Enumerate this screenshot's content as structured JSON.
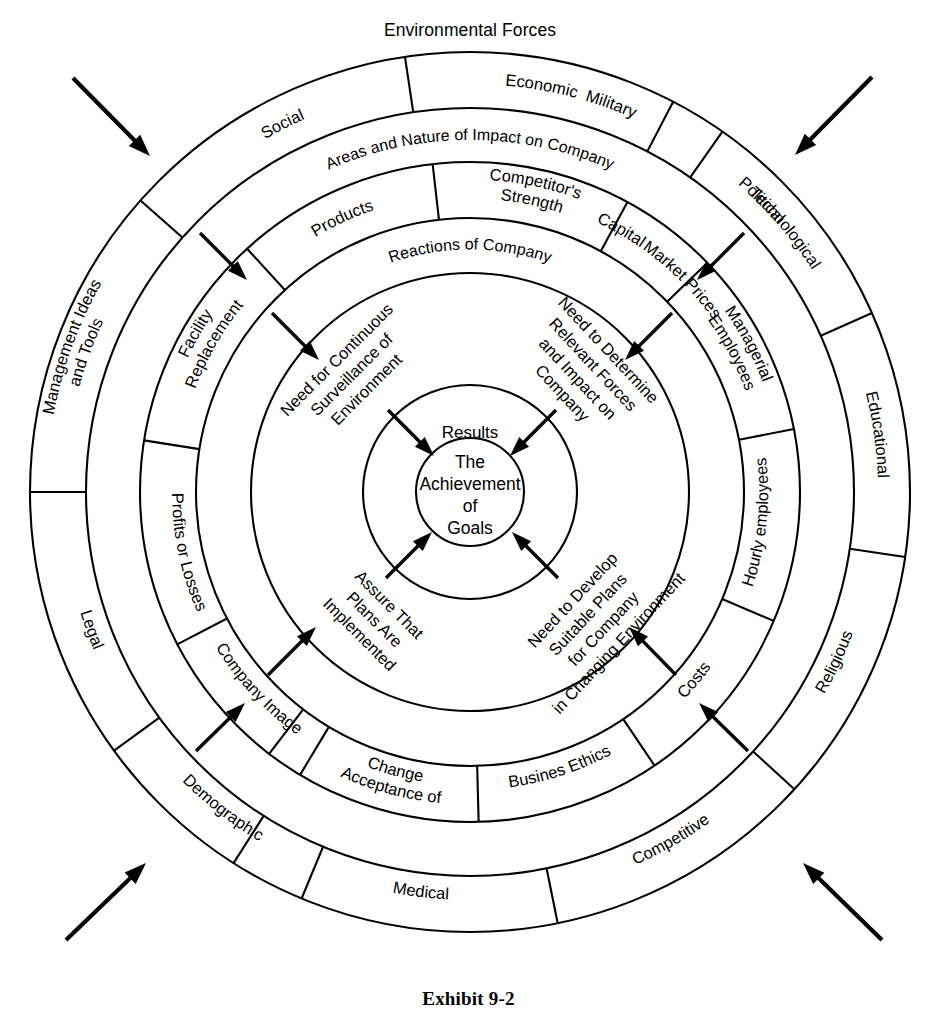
{
  "diagram": {
    "title": "Environmental Forces",
    "caption": "Exhibit 9-2",
    "center_x": 470,
    "center_y": 492,
    "colors": {
      "stroke": "#000000",
      "background": "#ffffff"
    }
  },
  "rings": {
    "ring1": {
      "name": "Environmental Forces",
      "label": "Environmental Forces",
      "r_outer": 440,
      "r_inner": 384,
      "segments": [
        {
          "label": "Military",
          "mid_deg": -70
        },
        {
          "label": "Technological",
          "mid_deg": -40
        },
        {
          "label": "Educational",
          "mid_deg": -8
        },
        {
          "label": "Religious",
          "mid_deg": 25
        },
        {
          "label": "Competitive",
          "mid_deg": 60
        },
        {
          "label": "Medical",
          "mid_deg": 97
        },
        {
          "label": "Demographic",
          "mid_deg": 128
        },
        {
          "label": "Legal",
          "mid_deg": 160
        },
        {
          "label": "Management Ideas and Tools",
          "mid_deg": 200
        },
        {
          "label": "Social",
          "mid_deg": 243
        },
        {
          "label": "Economic",
          "mid_deg": 280
        },
        {
          "label": "Political",
          "mid_deg": 315
        }
      ]
    },
    "ring2": {
      "name": "Areas and Nature of Impact on Company",
      "label": "Areas and Nature of Impact on Company",
      "r_outer": 384,
      "r_inner": 330
    },
    "ring3": {
      "name": "Company Impact Areas",
      "r_outer": 330,
      "r_inner": 274,
      "segments": [
        {
          "label": "Capital",
          "mid_deg": -60
        },
        {
          "label": "Managerial Employees",
          "mid_deg": -28
        },
        {
          "label": "Hourly employees",
          "mid_deg": 6
        },
        {
          "label": "Costs",
          "mid_deg": 40
        },
        {
          "label": "Busines Ethics",
          "mid_deg": 72
        },
        {
          "label": "Acceptance of Change",
          "mid_deg": 105
        },
        {
          "label": "Company Image",
          "mid_deg": 137
        },
        {
          "label": "Profits or Losses",
          "mid_deg": 168
        },
        {
          "label": "Facility Replacement",
          "mid_deg": 210
        },
        {
          "label": "Products",
          "mid_deg": 245
        },
        {
          "label": "Competitor's Strength",
          "mid_deg": 282
        },
        {
          "label": "Market Prices",
          "mid_deg": 315
        }
      ]
    },
    "ring4": {
      "name": "Reactions of Company",
      "label": "Reactions of Company",
      "r_outer": 274,
      "r_inner": 219
    },
    "ring5": {
      "name": "Company Actions",
      "r_outer": 219,
      "r_inner": 107,
      "quadrant_texts": [
        {
          "lines": [
            "Need for Continuous",
            "Surveillance of",
            "Environment"
          ],
          "mid_deg": 310
        },
        {
          "lines": [
            "Need to Determine",
            "Relevant Forces",
            "and Impact on",
            "Company"
          ],
          "mid_deg": 320
        },
        {
          "lines": [
            "Assure That",
            "Plans Are",
            "Implemented"
          ],
          "mid_deg": 220
        },
        {
          "lines": [
            "Need to Develop",
            "Suitable Plans",
            "for Company",
            "in Changing Environment"
          ],
          "mid_deg": 50
        }
      ]
    },
    "ring6": {
      "name": "Results",
      "label": "Results",
      "r_outer": 107,
      "r_inner": 54
    },
    "center": {
      "name": "The Achievement of Goals",
      "lines": [
        "The",
        "Achievement",
        "of",
        "Goals"
      ],
      "r": 54
    }
  },
  "arrows": {
    "outer": [
      {
        "name": "arrow-outer-top-left",
        "from": [
          73,
          78
        ],
        "to": [
          150,
          156
        ]
      },
      {
        "name": "arrow-outer-top-right",
        "from": [
          872,
          77
        ],
        "to": [
          795,
          155
        ]
      },
      {
        "name": "arrow-outer-bottom-left",
        "from": [
          66,
          940
        ],
        "to": [
          146,
          863
        ]
      },
      {
        "name": "arrow-outer-bottom-right",
        "from": [
          882,
          940
        ],
        "to": [
          803,
          863
        ]
      }
    ],
    "ring2": [
      {
        "name": "arrow-ring2-top-left",
        "from": [
          200,
          233
        ],
        "to": [
          247,
          280
        ]
      },
      {
        "name": "arrow-ring2-top-right",
        "from": [
          744,
          233
        ],
        "to": [
          697,
          280
        ]
      },
      {
        "name": "arrow-ring2-bottom-left",
        "from": [
          196,
          751
        ],
        "to": [
          245,
          703
        ]
      },
      {
        "name": "arrow-ring2-bottom-right",
        "from": [
          748,
          751
        ],
        "to": [
          699,
          703
        ]
      }
    ],
    "ring4": [
      {
        "name": "arrow-ring4-top-left",
        "from": [
          272,
          313
        ],
        "to": [
          319,
          360
        ]
      },
      {
        "name": "arrow-ring4-top-right",
        "from": [
          672,
          313
        ],
        "to": [
          625,
          360
        ]
      },
      {
        "name": "arrow-ring4-bottom-left",
        "from": [
          268,
          675
        ],
        "to": [
          316,
          627
        ]
      },
      {
        "name": "arrow-ring4-bottom-right",
        "from": [
          676,
          675
        ],
        "to": [
          629,
          627
        ]
      }
    ],
    "center": [
      {
        "name": "arrow-center-top-left",
        "from": [
          388,
          410
        ],
        "to": [
          434,
          456
        ]
      },
      {
        "name": "arrow-center-top-right",
        "from": [
          556,
          410
        ],
        "to": [
          510,
          456
        ]
      },
      {
        "name": "arrow-center-bottom-left",
        "from": [
          386,
          578
        ],
        "to": [
          432,
          532
        ]
      },
      {
        "name": "arrow-center-bottom-right",
        "from": [
          558,
          578
        ],
        "to": [
          512,
          532
        ]
      }
    ]
  }
}
